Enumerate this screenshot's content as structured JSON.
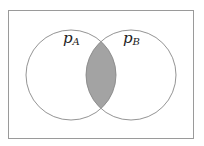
{
  "diagram": {
    "type": "venn",
    "sets": [
      {
        "id": "A",
        "label_main": "p",
        "label_sub": "A"
      },
      {
        "id": "B",
        "label_main": "p",
        "label_sub": "B"
      }
    ],
    "shaded_region": "intersection",
    "colors": {
      "stroke": "#888888",
      "frame": "#999999",
      "shade": "#a3a3a3",
      "background": "#ffffff"
    }
  }
}
